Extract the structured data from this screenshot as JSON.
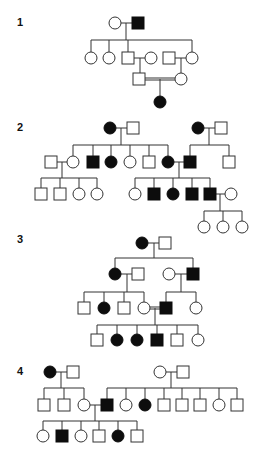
{
  "figure": {
    "type": "pedigree-diagrams",
    "symbol_size": 12,
    "colors": {
      "affected": "#0d0d0d",
      "unaffected": "#ffffff",
      "line": "#333333"
    },
    "legend_semantics": {
      "square": "male",
      "circle": "female",
      "filled": "affected",
      "open": "unaffected",
      "double_line": "consanguineous mating"
    }
  },
  "panels": [
    {
      "id": "1",
      "label": "1",
      "label_pos": [
        17,
        26
      ],
      "individuals": [
        {
          "id": "p1-I-1",
          "sex": "female",
          "affected": false,
          "x": 115,
          "y": 23
        },
        {
          "id": "p1-I-2",
          "sex": "male",
          "affected": true,
          "x": 138,
          "y": 23
        },
        {
          "id": "p1-II-1",
          "sex": "female",
          "affected": false,
          "x": 91,
          "y": 58
        },
        {
          "id": "p1-II-2",
          "sex": "female",
          "affected": false,
          "x": 109,
          "y": 58
        },
        {
          "id": "p1-II-3",
          "sex": "male",
          "affected": false,
          "x": 128,
          "y": 58
        },
        {
          "id": "p1-II-4",
          "sex": "female",
          "affected": false,
          "x": 151,
          "y": 58
        },
        {
          "id": "p1-II-5",
          "sex": "male",
          "affected": false,
          "x": 169,
          "y": 58
        },
        {
          "id": "p1-II-6",
          "sex": "female",
          "affected": false,
          "x": 192,
          "y": 58
        },
        {
          "id": "p1-III-1",
          "sex": "male",
          "affected": false,
          "x": 139,
          "y": 79
        },
        {
          "id": "p1-III-2",
          "sex": "female",
          "affected": false,
          "x": 181,
          "y": 79
        },
        {
          "id": "p1-IV-1",
          "sex": "female",
          "affected": true,
          "x": 160,
          "y": 102
        }
      ],
      "lines": [
        [
          121,
          23,
          132,
          23
        ],
        [
          126,
          23,
          126,
          40
        ],
        [
          91,
          40,
          192,
          40
        ],
        [
          91,
          40,
          91,
          52
        ],
        [
          109,
          40,
          109,
          52
        ],
        [
          128,
          40,
          128,
          52
        ],
        [
          192,
          40,
          192,
          52
        ],
        [
          134,
          58,
          145,
          58
        ],
        [
          140,
          58,
          140,
          73
        ],
        [
          175,
          58,
          186,
          58
        ],
        [
          181,
          58,
          181,
          73
        ],
        [
          160,
          79,
          160,
          96
        ]
      ],
      "double_lines": [
        [
          145,
          78,
          175,
          78
        ]
      ]
    },
    {
      "id": "2",
      "label": "2",
      "label_pos": [
        17,
        131
      ],
      "individuals": [
        {
          "id": "p2-I-1",
          "sex": "female",
          "affected": true,
          "x": 110,
          "y": 128
        },
        {
          "id": "p2-I-2",
          "sex": "male",
          "affected": false,
          "x": 133,
          "y": 128
        },
        {
          "id": "p2-I-3",
          "sex": "female",
          "affected": true,
          "x": 198,
          "y": 128
        },
        {
          "id": "p2-I-4",
          "sex": "male",
          "affected": false,
          "x": 221,
          "y": 128
        },
        {
          "id": "p2-II-1",
          "sex": "male",
          "affected": false,
          "x": 51,
          "y": 162
        },
        {
          "id": "p2-II-2",
          "sex": "female",
          "affected": false,
          "x": 73,
          "y": 162
        },
        {
          "id": "p2-II-3",
          "sex": "male",
          "affected": true,
          "x": 93,
          "y": 162
        },
        {
          "id": "p2-II-4",
          "sex": "female",
          "affected": true,
          "x": 111,
          "y": 162
        },
        {
          "id": "p2-II-5",
          "sex": "female",
          "affected": false,
          "x": 130,
          "y": 162
        },
        {
          "id": "p2-II-6",
          "sex": "male",
          "affected": false,
          "x": 149,
          "y": 162
        },
        {
          "id": "p2-II-7",
          "sex": "female",
          "affected": true,
          "x": 168,
          "y": 162
        },
        {
          "id": "p2-II-8",
          "sex": "male",
          "affected": true,
          "x": 190,
          "y": 162
        },
        {
          "id": "p2-II-9",
          "sex": "male",
          "affected": false,
          "x": 229,
          "y": 162
        },
        {
          "id": "p2-III-1",
          "sex": "male",
          "affected": false,
          "x": 41,
          "y": 194
        },
        {
          "id": "p2-III-2",
          "sex": "male",
          "affected": false,
          "x": 60,
          "y": 194
        },
        {
          "id": "p2-III-3",
          "sex": "female",
          "affected": false,
          "x": 79,
          "y": 194
        },
        {
          "id": "p2-III-4",
          "sex": "female",
          "affected": false,
          "x": 97,
          "y": 194
        },
        {
          "id": "p2-III-5",
          "sex": "female",
          "affected": false,
          "x": 135,
          "y": 194
        },
        {
          "id": "p2-III-6",
          "sex": "male",
          "affected": true,
          "x": 154,
          "y": 194
        },
        {
          "id": "p2-III-7",
          "sex": "female",
          "affected": true,
          "x": 173,
          "y": 194
        },
        {
          "id": "p2-III-8",
          "sex": "male",
          "affected": true,
          "x": 192,
          "y": 194
        },
        {
          "id": "p2-III-9",
          "sex": "male",
          "affected": true,
          "x": 210,
          "y": 194
        },
        {
          "id": "p2-III-10",
          "sex": "female",
          "affected": false,
          "x": 231,
          "y": 194
        },
        {
          "id": "p2-IV-1",
          "sex": "female",
          "affected": false,
          "x": 204,
          "y": 227
        },
        {
          "id": "p2-IV-2",
          "sex": "female",
          "affected": false,
          "x": 223,
          "y": 227
        },
        {
          "id": "p2-IV-3",
          "sex": "female",
          "affected": false,
          "x": 242,
          "y": 227
        }
      ],
      "lines": [
        [
          116,
          128,
          127,
          128
        ],
        [
          121,
          128,
          121,
          145
        ],
        [
          73,
          145,
          168,
          145
        ],
        [
          73,
          145,
          73,
          156
        ],
        [
          93,
          145,
          93,
          156
        ],
        [
          111,
          145,
          111,
          156
        ],
        [
          130,
          145,
          130,
          156
        ],
        [
          149,
          145,
          149,
          156
        ],
        [
          168,
          145,
          168,
          156
        ],
        [
          204,
          128,
          215,
          128
        ],
        [
          209,
          128,
          209,
          145
        ],
        [
          190,
          145,
          229,
          145
        ],
        [
          190,
          145,
          190,
          156
        ],
        [
          229,
          145,
          229,
          156
        ],
        [
          57,
          162,
          67,
          162
        ],
        [
          62,
          162,
          62,
          178
        ],
        [
          41,
          178,
          97,
          178
        ],
        [
          41,
          178,
          41,
          188
        ],
        [
          60,
          178,
          60,
          188
        ],
        [
          79,
          178,
          79,
          188
        ],
        [
          97,
          178,
          97,
          188
        ],
        [
          174,
          162,
          184,
          162
        ],
        [
          179,
          162,
          179,
          178
        ],
        [
          135,
          178,
          210,
          178
        ],
        [
          135,
          178,
          135,
          188
        ],
        [
          154,
          178,
          154,
          188
        ],
        [
          173,
          178,
          173,
          188
        ],
        [
          192,
          178,
          192,
          188
        ],
        [
          210,
          178,
          210,
          188
        ],
        [
          216,
          194,
          225,
          194
        ],
        [
          220,
          194,
          220,
          211
        ],
        [
          204,
          211,
          242,
          211
        ],
        [
          204,
          211,
          204,
          221
        ],
        [
          223,
          211,
          223,
          221
        ],
        [
          242,
          211,
          242,
          221
        ]
      ],
      "double_lines": []
    },
    {
      "id": "3",
      "label": "3",
      "label_pos": [
        17,
        243
      ],
      "individuals": [
        {
          "id": "p3-I-1",
          "sex": "female",
          "affected": true,
          "x": 142,
          "y": 243
        },
        {
          "id": "p3-I-2",
          "sex": "male",
          "affected": false,
          "x": 165,
          "y": 243
        },
        {
          "id": "p3-II-1",
          "sex": "female",
          "affected": true,
          "x": 115,
          "y": 274
        },
        {
          "id": "p3-II-2",
          "sex": "male",
          "affected": false,
          "x": 138,
          "y": 274
        },
        {
          "id": "p3-II-3",
          "sex": "female",
          "affected": false,
          "x": 169,
          "y": 274
        },
        {
          "id": "p3-II-4",
          "sex": "male",
          "affected": true,
          "x": 193,
          "y": 274
        },
        {
          "id": "p3-III-1",
          "sex": "male",
          "affected": false,
          "x": 84,
          "y": 308
        },
        {
          "id": "p3-III-2",
          "sex": "female",
          "affected": true,
          "x": 104,
          "y": 308
        },
        {
          "id": "p3-III-3",
          "sex": "male",
          "affected": false,
          "x": 124,
          "y": 308
        },
        {
          "id": "p3-III-4",
          "sex": "female",
          "affected": false,
          "x": 144,
          "y": 308
        },
        {
          "id": "p3-III-5",
          "sex": "male",
          "affected": true,
          "x": 166,
          "y": 308
        },
        {
          "id": "p3-III-6",
          "sex": "female",
          "affected": false,
          "x": 196,
          "y": 308
        },
        {
          "id": "p3-IV-1",
          "sex": "male",
          "affected": false,
          "x": 97,
          "y": 340
        },
        {
          "id": "p3-IV-2",
          "sex": "female",
          "affected": true,
          "x": 117,
          "y": 340
        },
        {
          "id": "p3-IV-3",
          "sex": "female",
          "affected": true,
          "x": 137,
          "y": 340
        },
        {
          "id": "p3-IV-4",
          "sex": "male",
          "affected": true,
          "x": 157,
          "y": 340
        },
        {
          "id": "p3-IV-5",
          "sex": "male",
          "affected": false,
          "x": 177,
          "y": 340
        },
        {
          "id": "p3-IV-6",
          "sex": "female",
          "affected": false,
          "x": 198,
          "y": 340
        }
      ],
      "lines": [
        [
          148,
          243,
          159,
          243
        ],
        [
          154,
          243,
          154,
          258
        ],
        [
          115,
          258,
          193,
          258
        ],
        [
          115,
          258,
          115,
          268
        ],
        [
          193,
          258,
          193,
          268
        ],
        [
          121,
          274,
          132,
          274
        ],
        [
          127,
          274,
          127,
          292
        ],
        [
          84,
          292,
          144,
          292
        ],
        [
          84,
          292,
          84,
          302
        ],
        [
          104,
          292,
          104,
          302
        ],
        [
          124,
          292,
          124,
          302
        ],
        [
          144,
          292,
          144,
          302
        ],
        [
          175,
          274,
          187,
          274
        ],
        [
          181,
          274,
          181,
          292
        ],
        [
          166,
          292,
          196,
          292
        ],
        [
          166,
          292,
          166,
          302
        ],
        [
          196,
          292,
          196,
          302
        ],
        [
          155,
          308,
          155,
          325
        ],
        [
          97,
          325,
          198,
          325
        ],
        [
          97,
          325,
          97,
          334
        ],
        [
          117,
          325,
          117,
          334
        ],
        [
          137,
          325,
          137,
          334
        ],
        [
          157,
          325,
          157,
          334
        ],
        [
          177,
          325,
          177,
          334
        ],
        [
          198,
          325,
          198,
          334
        ]
      ],
      "double_lines": [
        [
          150,
          307,
          160,
          307
        ]
      ]
    },
    {
      "id": "4",
      "label": "4",
      "label_pos": [
        17,
        375
      ],
      "individuals": [
        {
          "id": "p4-I-1",
          "sex": "female",
          "affected": true,
          "x": 50,
          "y": 372
        },
        {
          "id": "p4-I-2",
          "sex": "male",
          "affected": false,
          "x": 73,
          "y": 372
        },
        {
          "id": "p4-I-3",
          "sex": "female",
          "affected": false,
          "x": 160,
          "y": 372
        },
        {
          "id": "p4-I-4",
          "sex": "male",
          "affected": false,
          "x": 183,
          "y": 372
        },
        {
          "id": "p4-II-1",
          "sex": "male",
          "affected": false,
          "x": 44,
          "y": 405
        },
        {
          "id": "p4-II-2",
          "sex": "male",
          "affected": false,
          "x": 64,
          "y": 405
        },
        {
          "id": "p4-II-3",
          "sex": "female",
          "affected": false,
          "x": 84,
          "y": 405
        },
        {
          "id": "p4-II-4",
          "sex": "male",
          "affected": true,
          "x": 107,
          "y": 405
        },
        {
          "id": "p4-II-5",
          "sex": "female",
          "affected": false,
          "x": 126,
          "y": 405
        },
        {
          "id": "p4-II-6",
          "sex": "female",
          "affected": true,
          "x": 145,
          "y": 405
        },
        {
          "id": "p4-II-7",
          "sex": "male",
          "affected": false,
          "x": 164,
          "y": 405
        },
        {
          "id": "p4-II-8",
          "sex": "male",
          "affected": false,
          "x": 182,
          "y": 405
        },
        {
          "id": "p4-II-9",
          "sex": "male",
          "affected": false,
          "x": 200,
          "y": 405
        },
        {
          "id": "p4-II-10",
          "sex": "female",
          "affected": false,
          "x": 219,
          "y": 405
        },
        {
          "id": "p4-II-11",
          "sex": "male",
          "affected": false,
          "x": 237,
          "y": 405
        },
        {
          "id": "p4-III-1",
          "sex": "female",
          "affected": false,
          "x": 43,
          "y": 436
        },
        {
          "id": "p4-III-2",
          "sex": "male",
          "affected": true,
          "x": 62,
          "y": 436
        },
        {
          "id": "p4-III-3",
          "sex": "female",
          "affected": false,
          "x": 81,
          "y": 436
        },
        {
          "id": "p4-III-4",
          "sex": "male",
          "affected": false,
          "x": 99,
          "y": 436
        },
        {
          "id": "p4-III-5",
          "sex": "female",
          "affected": true,
          "x": 118,
          "y": 436
        },
        {
          "id": "p4-III-6",
          "sex": "male",
          "affected": false,
          "x": 137,
          "y": 436
        }
      ],
      "lines": [
        [
          56,
          372,
          67,
          372
        ],
        [
          61,
          372,
          61,
          388
        ],
        [
          44,
          388,
          84,
          388
        ],
        [
          44,
          388,
          44,
          399
        ],
        [
          64,
          388,
          64,
          399
        ],
        [
          84,
          388,
          84,
          399
        ],
        [
          166,
          372,
          177,
          372
        ],
        [
          171,
          372,
          171,
          388
        ],
        [
          107,
          388,
          237,
          388
        ],
        [
          107,
          388,
          107,
          399
        ],
        [
          126,
          388,
          126,
          399
        ],
        [
          145,
          388,
          145,
          399
        ],
        [
          164,
          388,
          164,
          399
        ],
        [
          182,
          388,
          182,
          399
        ],
        [
          200,
          388,
          200,
          399
        ],
        [
          219,
          388,
          219,
          399
        ],
        [
          237,
          388,
          237,
          399
        ],
        [
          90,
          405,
          101,
          405
        ],
        [
          95,
          405,
          95,
          421
        ],
        [
          43,
          421,
          137,
          421
        ],
        [
          43,
          421,
          43,
          430
        ],
        [
          62,
          421,
          62,
          430
        ],
        [
          81,
          421,
          81,
          430
        ],
        [
          99,
          421,
          99,
          430
        ],
        [
          118,
          421,
          118,
          430
        ],
        [
          137,
          421,
          137,
          430
        ]
      ],
      "double_lines": []
    }
  ]
}
